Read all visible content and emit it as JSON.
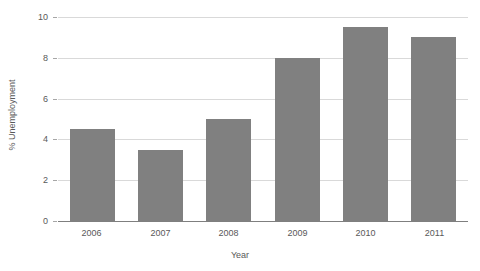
{
  "chart_data": {
    "type": "bar",
    "title": "",
    "subtitle": "",
    "xlabel": "Year",
    "ylabel": "% Unemployment",
    "categories": [
      "2006",
      "2007",
      "2008",
      "2009",
      "2010",
      "2011"
    ],
    "values": [
      4.5,
      3.5,
      5.0,
      8.0,
      9.5,
      9.0
    ],
    "series": [
      {
        "name": "% Unemployment",
        "values": [
          4.5,
          3.5,
          5.0,
          8.0,
          9.5,
          9.0
        ]
      }
    ],
    "ylim": [
      0,
      10
    ],
    "y_ticks": [
      "0",
      "2",
      "4",
      "6",
      "8",
      "10"
    ],
    "y_tick_values": [
      0,
      2,
      4,
      6,
      8,
      10
    ],
    "grid": true,
    "grid_axis": "y",
    "legend": false,
    "legend_position": "none",
    "bar_color": "#808080",
    "grid_color": "#d9d9d9",
    "axis_color": "#7f7f7f",
    "text_color": "#595959",
    "background": "#ffffff"
  }
}
